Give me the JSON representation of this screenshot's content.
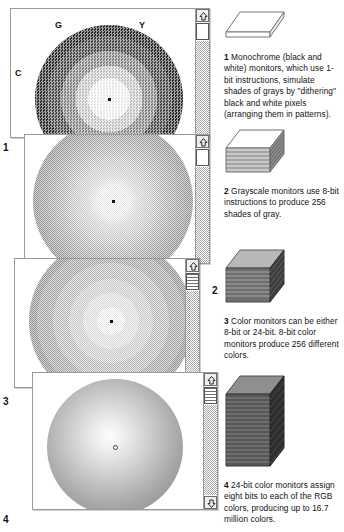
{
  "panels": [
    {
      "number": "1",
      "mode": "monochrome-dither",
      "wheel_labels": [
        {
          "key": "G",
          "text": "G"
        },
        {
          "key": "Y",
          "text": "Y"
        },
        {
          "key": "C",
          "text": "C"
        },
        {
          "key": "R",
          "text": "R"
        }
      ]
    },
    {
      "number": "2",
      "mode": "grayscale-dither",
      "wheel_labels": []
    },
    {
      "number": "3",
      "mode": "8-bit-banded",
      "wheel_labels": []
    },
    {
      "number": "4",
      "mode": "24-bit-smooth",
      "wheel_labels": []
    }
  ],
  "captions": [
    {
      "number": "1",
      "icon": "single-slab-icon",
      "text": "Monochrome (black and white) monitors, which use 1-bit instructions, simulate shades of grays by \"dithering\" black and white pixels (arranging them in patterns)."
    },
    {
      "number": "2",
      "icon": "thin-stack-icon",
      "text": "Grayscale monitors use 8-bit instructions to produce 256 shades of gray."
    },
    {
      "number": "3",
      "icon": "medium-stack-icon",
      "text": "Color monitors can be either 8-bit or 24-bit. 8-bit color monitors produce 256 different colors."
    },
    {
      "number": "4",
      "icon": "tall-stack-icon",
      "text": "24-bit color monitors assign eight bits to each of the RGB colors, producing up to 16.7 million colors."
    }
  ],
  "scrollbar": {
    "up_arrow": "scroll-up-arrow-icon",
    "down_arrow": "scroll-down-arrow-icon"
  },
  "colors": {
    "ink": "#111111",
    "panel_border": "#9a9a9a",
    "scrollbar_border": "#6d6d6d",
    "track": "#a8a8a8"
  }
}
